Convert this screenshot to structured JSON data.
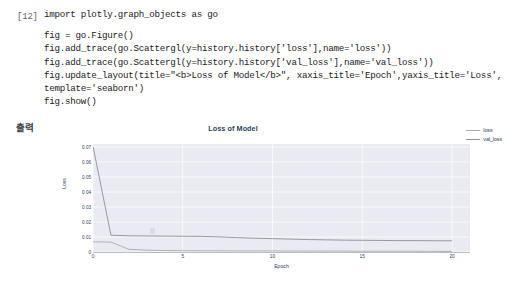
{
  "notebook": {
    "prompt": "[12]",
    "output_label": "출력",
    "code_lines": [
      "import plotly.graph_objects as go",
      "",
      "fig = go.Figure()",
      "fig.add_trace(go.Scattergl(y=history.history['loss'],name='loss'))",
      "fig.add_trace(go.Scattergl(y=history.history['val_loss'],name='val_loss'))",
      "fig.update_layout(title=\"<b>Loss of Model</b>\", xaxis_title='Epoch',yaxis_title='Loss',",
      "template='seaborn')",
      "fig.show()"
    ]
  },
  "chart_data": {
    "type": "line",
    "title": "Loss of Model",
    "xlabel": "Epoch",
    "ylabel": "Loss",
    "xlim": [
      0,
      21
    ],
    "ylim": [
      0,
      0.072
    ],
    "xticks": [
      "0",
      "5",
      "10",
      "15",
      "20"
    ],
    "xtick_values": [
      0,
      5,
      10,
      15,
      20
    ],
    "yticks": [
      "0",
      "0.01",
      "0.02",
      "0.03",
      "0.04",
      "0.05",
      "0.06",
      "0.07"
    ],
    "ytick_values": [
      0,
      0.01,
      0.02,
      0.03,
      0.04,
      0.05,
      0.06,
      0.07
    ],
    "grid": true,
    "legend_position": "top-right",
    "template": "seaborn",
    "plot_bgcolor": "#eaeaf2",
    "gridcolor": "#ffffff",
    "x": [
      0,
      1,
      2,
      3,
      4,
      5,
      6,
      7,
      8,
      9,
      10,
      11,
      12,
      13,
      14,
      15,
      16,
      17,
      18,
      19,
      20
    ],
    "series": [
      {
        "name": "loss",
        "color": "#a9a9b3",
        "values": [
          0.0068,
          0.0066,
          0.0018,
          0.0012,
          0.001,
          0.0009,
          0.0008,
          0.0008,
          0.0007,
          0.0007,
          0.0007,
          0.0006,
          0.0006,
          0.0006,
          0.0006,
          0.0005,
          0.0005,
          0.0005,
          0.0005,
          0.0004,
          0.0004
        ]
      },
      {
        "name": "val_loss",
        "color": "#8f8f9b",
        "values": [
          0.0705,
          0.0112,
          0.0108,
          0.0107,
          0.0106,
          0.0105,
          0.0104,
          0.0101,
          0.0096,
          0.0092,
          0.0089,
          0.0086,
          0.0083,
          0.0081,
          0.0079,
          0.0078,
          0.0077,
          0.0076,
          0.0076,
          0.0075,
          0.0075
        ]
      }
    ]
  }
}
